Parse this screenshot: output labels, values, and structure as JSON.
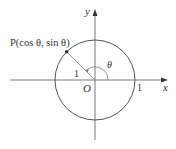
{
  "diagram": {
    "colors": {
      "axis": "#7a7a7a",
      "circle": "#555555",
      "radius": "#9a9a9a",
      "text": "#333333",
      "point": "#333333"
    },
    "geometry": {
      "origin": [
        95,
        80
      ],
      "radius": 40,
      "theta_degrees": 135
    },
    "labels": {
      "y_axis": "y",
      "x_axis": "x",
      "origin": "O",
      "x_intercept": "1",
      "radius_length": "1",
      "angle": "θ",
      "point": "P(cos θ, sin θ)"
    }
  }
}
